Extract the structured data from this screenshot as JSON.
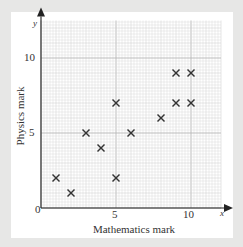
{
  "chart_data": {
    "type": "scatter",
    "title": "",
    "xlabel": "Mathematics mark",
    "ylabel": "Physics mark",
    "x_axis_letter": "x",
    "y_axis_letter": "y",
    "origin_label": "0",
    "xticks": [
      "5",
      "10"
    ],
    "yticks": [
      "5",
      "10"
    ],
    "xlim": [
      0,
      12
    ],
    "ylim": [
      0,
      12.5
    ],
    "grid": true,
    "marker": "x",
    "points": [
      {
        "x": 1,
        "y": 2
      },
      {
        "x": 2,
        "y": 1
      },
      {
        "x": 3,
        "y": 5
      },
      {
        "x": 4,
        "y": 4
      },
      {
        "x": 5,
        "y": 2
      },
      {
        "x": 5,
        "y": 7
      },
      {
        "x": 6,
        "y": 5
      },
      {
        "x": 8,
        "y": 6
      },
      {
        "x": 9,
        "y": 7
      },
      {
        "x": 9,
        "y": 9
      },
      {
        "x": 10,
        "y": 7
      },
      {
        "x": 10,
        "y": 9
      }
    ],
    "colors": {
      "background": "#e7e7e6",
      "panel": "#ffffff",
      "grid_minor": "#d9d9d9",
      "grid_major": "#b5b5b5",
      "axis": "#222222",
      "marker": "#333333"
    }
  }
}
